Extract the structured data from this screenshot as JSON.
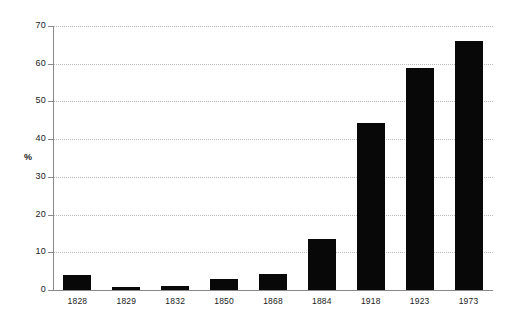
{
  "chart_data": {
    "type": "bar",
    "title": "",
    "subtitle": "",
    "xlabel": "",
    "ylabel": "%",
    "categories": [
      "1828",
      "1829",
      "1832",
      "1850",
      "1868",
      "1884",
      "1918",
      "1923",
      "1973"
    ],
    "values": [
      4,
      0.8,
      1,
      2.8,
      4.2,
      13.5,
      44.3,
      59,
      66
    ],
    "ylim": [
      0,
      70
    ],
    "yticks": [
      0,
      10,
      20,
      30,
      40,
      50,
      60,
      70
    ],
    "ytick_labels": [
      "0",
      "10",
      "20",
      "30",
      "40",
      "50",
      "60",
      "70"
    ],
    "grid": "horizontal-dotted",
    "legend": "none",
    "bar_color": "#080808",
    "grid_color": "#b9b9b9",
    "axis_color": "#8a8a8a",
    "background": "#ffffff"
  }
}
